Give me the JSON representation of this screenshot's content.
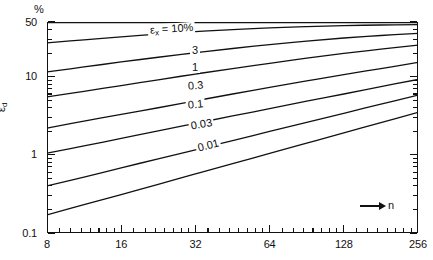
{
  "chart_data": {
    "type": "line",
    "title": "",
    "subtitle": "",
    "xlabel": "n",
    "ylabel": "εd",
    "y_unit_label": "%",
    "xscale": "log2",
    "yscale": "log10",
    "xlim": [
      8,
      256
    ],
    "ylim": [
      0.1,
      50
    ],
    "grid": false,
    "legend": "inline-curve-labels",
    "x_ticks": [
      8,
      16,
      32,
      64,
      128,
      256
    ],
    "x_tick_labels": [
      "8",
      "16",
      "32",
      "64",
      "128",
      "256"
    ],
    "y_ticks": [
      0.1,
      1,
      10,
      50
    ],
    "y_tick_labels": [
      "0.1",
      "1",
      "10",
      "50"
    ],
    "x": [
      8,
      11.3,
      16,
      22.6,
      32,
      45.3,
      64,
      90.5,
      128,
      181,
      256
    ],
    "series": [
      {
        "name": "εx = 10%",
        "label": "εx = 10%",
        "values": [
          50,
          50,
          50,
          50,
          50,
          50,
          50,
          50,
          50,
          50,
          50
        ]
      },
      {
        "name": "3",
        "label": "3",
        "values": [
          27.0,
          29.6,
          32.3,
          35.0,
          37.6,
          40.0,
          42.0,
          43.6,
          44.9,
          45.8,
          46.4
        ]
      },
      {
        "name": "1",
        "label": "1",
        "values": [
          11.5,
          13.3,
          15.4,
          17.7,
          20.2,
          22.9,
          25.7,
          28.5,
          31.2,
          33.6,
          35.7
        ]
      },
      {
        "name": "0.3",
        "label": "0.3",
        "values": [
          5.5,
          6.5,
          7.7,
          9.1,
          10.8,
          12.7,
          14.8,
          17.2,
          19.8,
          22.5,
          25.3
        ]
      },
      {
        "name": "0.1",
        "label": "0.1",
        "values": [
          2.2,
          2.7,
          3.3,
          4.0,
          4.9,
          6.0,
          7.3,
          8.8,
          10.6,
          12.7,
          15.2
        ]
      },
      {
        "name": "0.03",
        "label": "0.03",
        "values": [
          1.05,
          1.3,
          1.62,
          2.02,
          2.52,
          3.14,
          3.9,
          4.85,
          6.0,
          7.45,
          9.2
        ]
      },
      {
        "name": "0.01",
        "label": "0.01",
        "values": [
          0.4,
          0.52,
          0.68,
          0.89,
          1.16,
          1.52,
          1.99,
          2.6,
          3.4,
          4.45,
          5.8
        ]
      },
      {
        "name": "lowest",
        "label": "",
        "values": [
          0.17,
          0.23,
          0.31,
          0.42,
          0.57,
          0.77,
          1.04,
          1.41,
          1.91,
          2.58,
          3.5
        ]
      }
    ],
    "curve_labels": [
      {
        "text": "εx = 10%",
        "x_px": 148,
        "y_px": 25,
        "rotate": -4
      },
      {
        "text": "3",
        "x_px": 190,
        "y_px": 45,
        "rotate": 0
      },
      {
        "text": "1",
        "x_px": 190,
        "y_px": 62,
        "rotate": 0
      },
      {
        "text": "0.3",
        "x_px": 186,
        "y_px": 81,
        "rotate": -5
      },
      {
        "text": "0.1",
        "x_px": 186,
        "y_px": 100,
        "rotate": -6
      },
      {
        "text": "0.03",
        "x_px": 189,
        "y_px": 121,
        "rotate": -10
      },
      {
        "text": "0.01",
        "x_px": 196,
        "y_px": 143,
        "rotate": -14
      }
    ]
  }
}
